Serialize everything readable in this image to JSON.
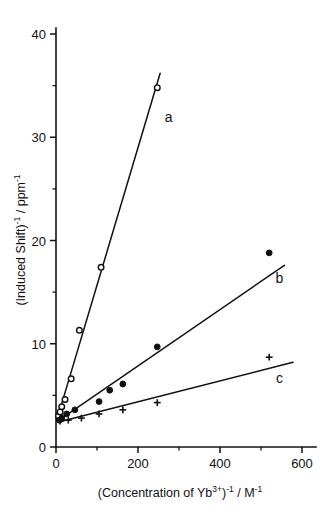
{
  "figure": {
    "background_color": "#ffffff",
    "ink_color": "#101010"
  },
  "axes": {
    "x_title_parts": {
      "open_paren": "(Concentration of Yb",
      "charge": "3+",
      "close_paren": ")",
      "inv1": "-1",
      "slash_unit": "/ M",
      "inv2": "-1"
    },
    "y_title_parts": {
      "open_paren": "(Induced Shift)",
      "inv1": "-1",
      "slash_unit": "/ ppm",
      "inv2": "-1"
    },
    "x_ticklabels": [
      "0",
      "200",
      "400",
      "600"
    ],
    "y_ticklabels": [
      "0",
      "10",
      "20",
      "30",
      "40"
    ]
  },
  "chart_data": {
    "type": "line",
    "title": "",
    "xlabel": "(Concentration of Yb3+)-1 / M-1",
    "ylabel": "(Induced Shift)-1 / ppm-1",
    "xlim": [
      0,
      600
    ],
    "ylim": [
      0,
      40
    ],
    "xticks": [
      0,
      200,
      400,
      600
    ],
    "yticks": [
      0,
      10,
      20,
      30,
      40
    ],
    "xminorticks": [
      100,
      300,
      500
    ],
    "grid": false,
    "legend": "inline-curve-labels",
    "series": [
      {
        "name": "a",
        "label": "a",
        "marker": "open-circle",
        "label_x": 275,
        "label_y": 31.5,
        "points": [
          {
            "x": 6,
            "y": 3.0
          },
          {
            "x": 10,
            "y": 3.4
          },
          {
            "x": 14,
            "y": 3.9
          },
          {
            "x": 22,
            "y": 4.6
          },
          {
            "x": 37,
            "y": 6.6
          },
          {
            "x": 57,
            "y": 11.3
          },
          {
            "x": 110,
            "y": 17.4
          },
          {
            "x": 247,
            "y": 34.8
          }
        ],
        "fit_line": {
          "x0": 2,
          "y0": 2.6,
          "x1": 254,
          "y1": 36.2
        }
      },
      {
        "name": "b",
        "label": "b",
        "marker": "filled-circle",
        "label_x": 545,
        "label_y": 15.9,
        "points": [
          {
            "x": 8,
            "y": 2.6
          },
          {
            "x": 14,
            "y": 2.8
          },
          {
            "x": 26,
            "y": 3.2
          },
          {
            "x": 46,
            "y": 3.6
          },
          {
            "x": 105,
            "y": 4.4
          },
          {
            "x": 131,
            "y": 5.5
          },
          {
            "x": 163,
            "y": 6.1
          },
          {
            "x": 247,
            "y": 9.7
          },
          {
            "x": 520,
            "y": 18.8
          }
        ],
        "fit_line": {
          "x0": 4,
          "y0": 2.5,
          "x1": 557,
          "y1": 17.6
        }
      },
      {
        "name": "c",
        "label": "c",
        "marker": "plus",
        "label_x": 545,
        "label_y": 6.2,
        "points": [
          {
            "x": 10,
            "y": 2.5
          },
          {
            "x": 30,
            "y": 2.6
          },
          {
            "x": 62,
            "y": 2.8
          },
          {
            "x": 105,
            "y": 3.2
          },
          {
            "x": 163,
            "y": 3.6
          },
          {
            "x": 247,
            "y": 4.3
          },
          {
            "x": 520,
            "y": 8.7
          }
        ],
        "fit_line": {
          "x0": 4,
          "y0": 2.4,
          "x1": 578,
          "y1": 8.2
        }
      }
    ]
  }
}
